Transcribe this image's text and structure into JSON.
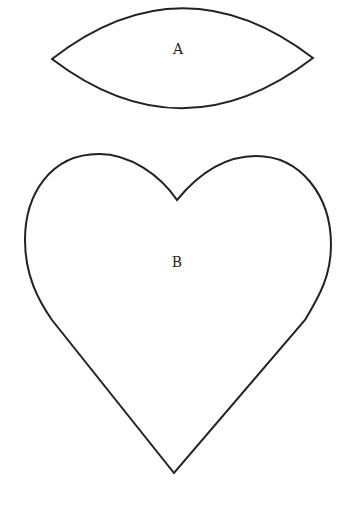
{
  "shapes": [
    {
      "id": "A",
      "kind": "lens",
      "label": "A"
    },
    {
      "id": "B",
      "kind": "heart",
      "label": "B"
    }
  ],
  "colors": {
    "stroke": "#222222",
    "background": "#ffffff"
  }
}
